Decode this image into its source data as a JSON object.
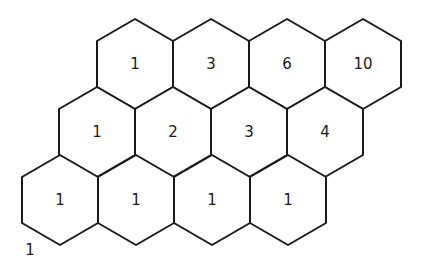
{
  "diagram": {
    "type": "hexagonal-grid",
    "hex_geometry": {
      "half_width": 38,
      "half_height": 45,
      "shoulder": 22
    },
    "rows": [
      {
        "name": "top-row",
        "center_y": 64,
        "cells": [
          {
            "cx": 135,
            "label": "1"
          },
          {
            "cx": 211,
            "label": "3"
          },
          {
            "cx": 287,
            "label": "6"
          },
          {
            "cx": 363,
            "label": "10"
          }
        ]
      },
      {
        "name": "middle-row",
        "center_y": 132,
        "cells": [
          {
            "cx": 97,
            "label": "1"
          },
          {
            "cx": 173,
            "label": "2"
          },
          {
            "cx": 249,
            "label": "3"
          },
          {
            "cx": 325,
            "label": "4"
          }
        ]
      },
      {
        "name": "bottom-row",
        "center_y": 200,
        "cells": [
          {
            "cx": 60,
            "label": "1"
          },
          {
            "cx": 136,
            "label": "1"
          },
          {
            "cx": 212,
            "label": "1"
          },
          {
            "cx": 288,
            "label": "1"
          }
        ]
      }
    ],
    "corner_label": {
      "text": "1",
      "x": 30,
      "y": 250
    },
    "colors": {
      "stroke": "#1a1a1a",
      "background": "#ffffff",
      "text": "#1a1a1a"
    }
  }
}
